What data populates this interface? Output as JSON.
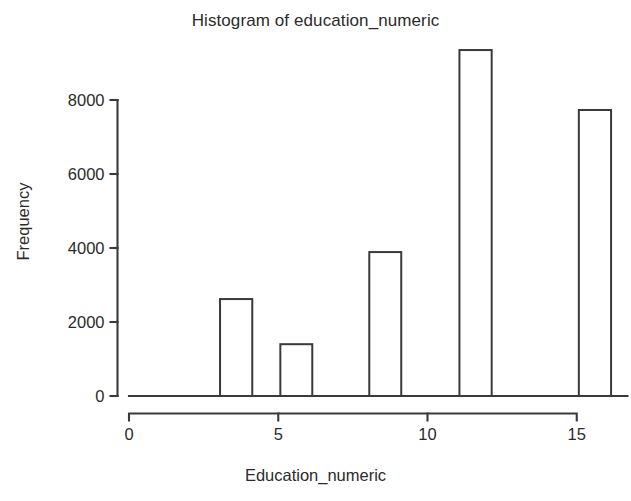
{
  "chart_data": {
    "type": "bar",
    "title": "Histogram of education_numeric",
    "xlabel": "Education_numeric",
    "ylabel": "Frequency",
    "xlim": [
      0,
      16.7
    ],
    "ylim": [
      0,
      9600
    ],
    "grid": false,
    "legend": null,
    "bar_style": "outlined-unfilled",
    "bin_width": 1.07,
    "x_ticks": [
      {
        "value": 0,
        "label": "0"
      },
      {
        "value": 5,
        "label": "5"
      },
      {
        "value": 10,
        "label": "10"
      },
      {
        "value": 15,
        "label": "15"
      }
    ],
    "y_ticks": [
      {
        "value": 0,
        "label": "0"
      },
      {
        "value": 2000,
        "label": "2000"
      },
      {
        "value": 4000,
        "label": "4000"
      },
      {
        "value": 6000,
        "label": "6000"
      },
      {
        "value": 8000,
        "label": "8000"
      }
    ],
    "bins": [
      {
        "x_start": 3.05,
        "x_end": 4.13,
        "center": 3.6,
        "value": 2620
      },
      {
        "x_start": 5.07,
        "x_end": 6.14,
        "center": 5.6,
        "value": 1400
      },
      {
        "x_start": 8.05,
        "x_end": 9.12,
        "center": 8.6,
        "value": 3890
      },
      {
        "x_start": 11.07,
        "x_end": 12.15,
        "center": 11.6,
        "value": 9350
      },
      {
        "x_start": 15.07,
        "x_end": 16.15,
        "center": 15.6,
        "value": 7730
      }
    ],
    "categories": [
      "3.6",
      "5.6",
      "8.6",
      "11.6",
      "15.6"
    ],
    "values": [
      2620,
      1400,
      3890,
      9350,
      7730
    ]
  },
  "colors": {
    "background": "#ffffff",
    "axis": "#3a3a3a",
    "text": "#2b2b2b",
    "bar_fill": "#ffffff",
    "bar_stroke": "#3a3a3a"
  }
}
